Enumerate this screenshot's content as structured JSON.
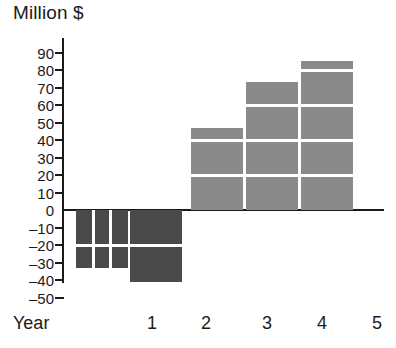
{
  "chart_data": {
    "type": "bar",
    "title": "Million $",
    "subtitle": "",
    "xlabel": "Year",
    "ylabel": "Million $",
    "categories": [
      "1",
      "2",
      "3",
      "4",
      "5"
    ],
    "x_tick_labels": [
      "1",
      "2",
      "3",
      "4",
      "5"
    ],
    "y_tick_labels": [
      "90",
      "80",
      "70",
      "60",
      "50",
      "40",
      "30",
      "20",
      "10",
      "0",
      "–10",
      "–20",
      "–30",
      "–40",
      "–50"
    ],
    "y_tick_values": [
      90,
      80,
      70,
      60,
      50,
      40,
      30,
      20,
      10,
      0,
      -10,
      -20,
      -30,
      -40,
      -50
    ],
    "ylim": [
      -50,
      90
    ],
    "y_tick_step": 10,
    "grid": false,
    "legend": false,
    "values": [
      -33,
      -41,
      47,
      73,
      85
    ],
    "bars": [
      {
        "category": "1",
        "value": -33,
        "sign": "negative",
        "color": "#4a4a4a",
        "segment_breaks": [
          -20
        ],
        "vertical_splits": 3
      },
      {
        "category": "2",
        "value": -41,
        "sign": "negative",
        "color": "#4a4a4a",
        "segment_breaks": [
          -20
        ],
        "vertical_splits": 1
      },
      {
        "category": "3",
        "value": 47,
        "sign": "positive",
        "color": "#8a8a8a",
        "segment_breaks": [
          20,
          40
        ],
        "vertical_splits": 1
      },
      {
        "category": "4",
        "value": 73,
        "sign": "positive",
        "color": "#8a8a8a",
        "segment_breaks": [
          20,
          40,
          60
        ],
        "vertical_splits": 1
      },
      {
        "category": "5",
        "value": 85,
        "sign": "positive",
        "color": "#8a8a8a",
        "segment_breaks": [
          20,
          40,
          60,
          80
        ],
        "vertical_splits": 1
      }
    ],
    "colors": {
      "positive_bar": "#8a8a8a",
      "negative_bar": "#4a4a4a",
      "axis": "#1a1a1a",
      "background": "#ffffff",
      "segment_divider": "#ffffff"
    }
  }
}
